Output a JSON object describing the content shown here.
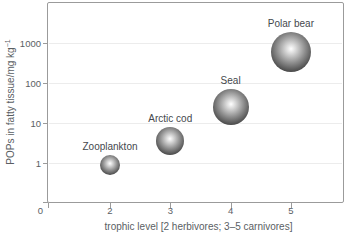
{
  "colors": {
    "axis": "#9b9b9b",
    "grid": "#ececec",
    "tick_text": "#5a5e63",
    "label_text": "#45484d",
    "bubble_center": "#ffffff",
    "bubble_edge": "#262626",
    "background": "#ffffff"
  },
  "chart_data": {
    "type": "scatter",
    "subtype": "bubble",
    "title": "",
    "xlabel": "trophic level [2 herbivores; 3–5 carnivores]",
    "ylabel": "POPs in fatty tissue/mg kg⁻¹",
    "ylabel_parts": {
      "base": "POPs in fatty tissue/mg kg",
      "exponent": "−1"
    },
    "y_scale": "log",
    "ylim": [
      0.1,
      5000
    ],
    "grid": "horizontal-light",
    "legend": "none",
    "x_ticks": [
      {
        "label": "0",
        "value": 0
      },
      {
        "label": "2",
        "value": 2
      },
      {
        "label": "3",
        "value": 3
      },
      {
        "label": "4",
        "value": 4
      },
      {
        "label": "5",
        "value": 5
      }
    ],
    "y_ticks": [
      {
        "label": "1",
        "value": 1
      },
      {
        "label": "10",
        "value": 10
      },
      {
        "label": "100",
        "value": 100
      },
      {
        "label": "1000",
        "value": 1000
      }
    ],
    "points": [
      {
        "label": "Zooplankton",
        "trophic_level": 2,
        "pops_mg_per_kg": 0.9,
        "radius_px": 10
      },
      {
        "label": "Arctic cod",
        "trophic_level": 3,
        "pops_mg_per_kg": 3.5,
        "radius_px": 14
      },
      {
        "label": "Seal",
        "trophic_level": 4,
        "pops_mg_per_kg": 25,
        "radius_px": 18
      },
      {
        "label": "Polar bear",
        "trophic_level": 5,
        "pops_mg_per_kg": 600,
        "radius_px": 20
      }
    ]
  }
}
